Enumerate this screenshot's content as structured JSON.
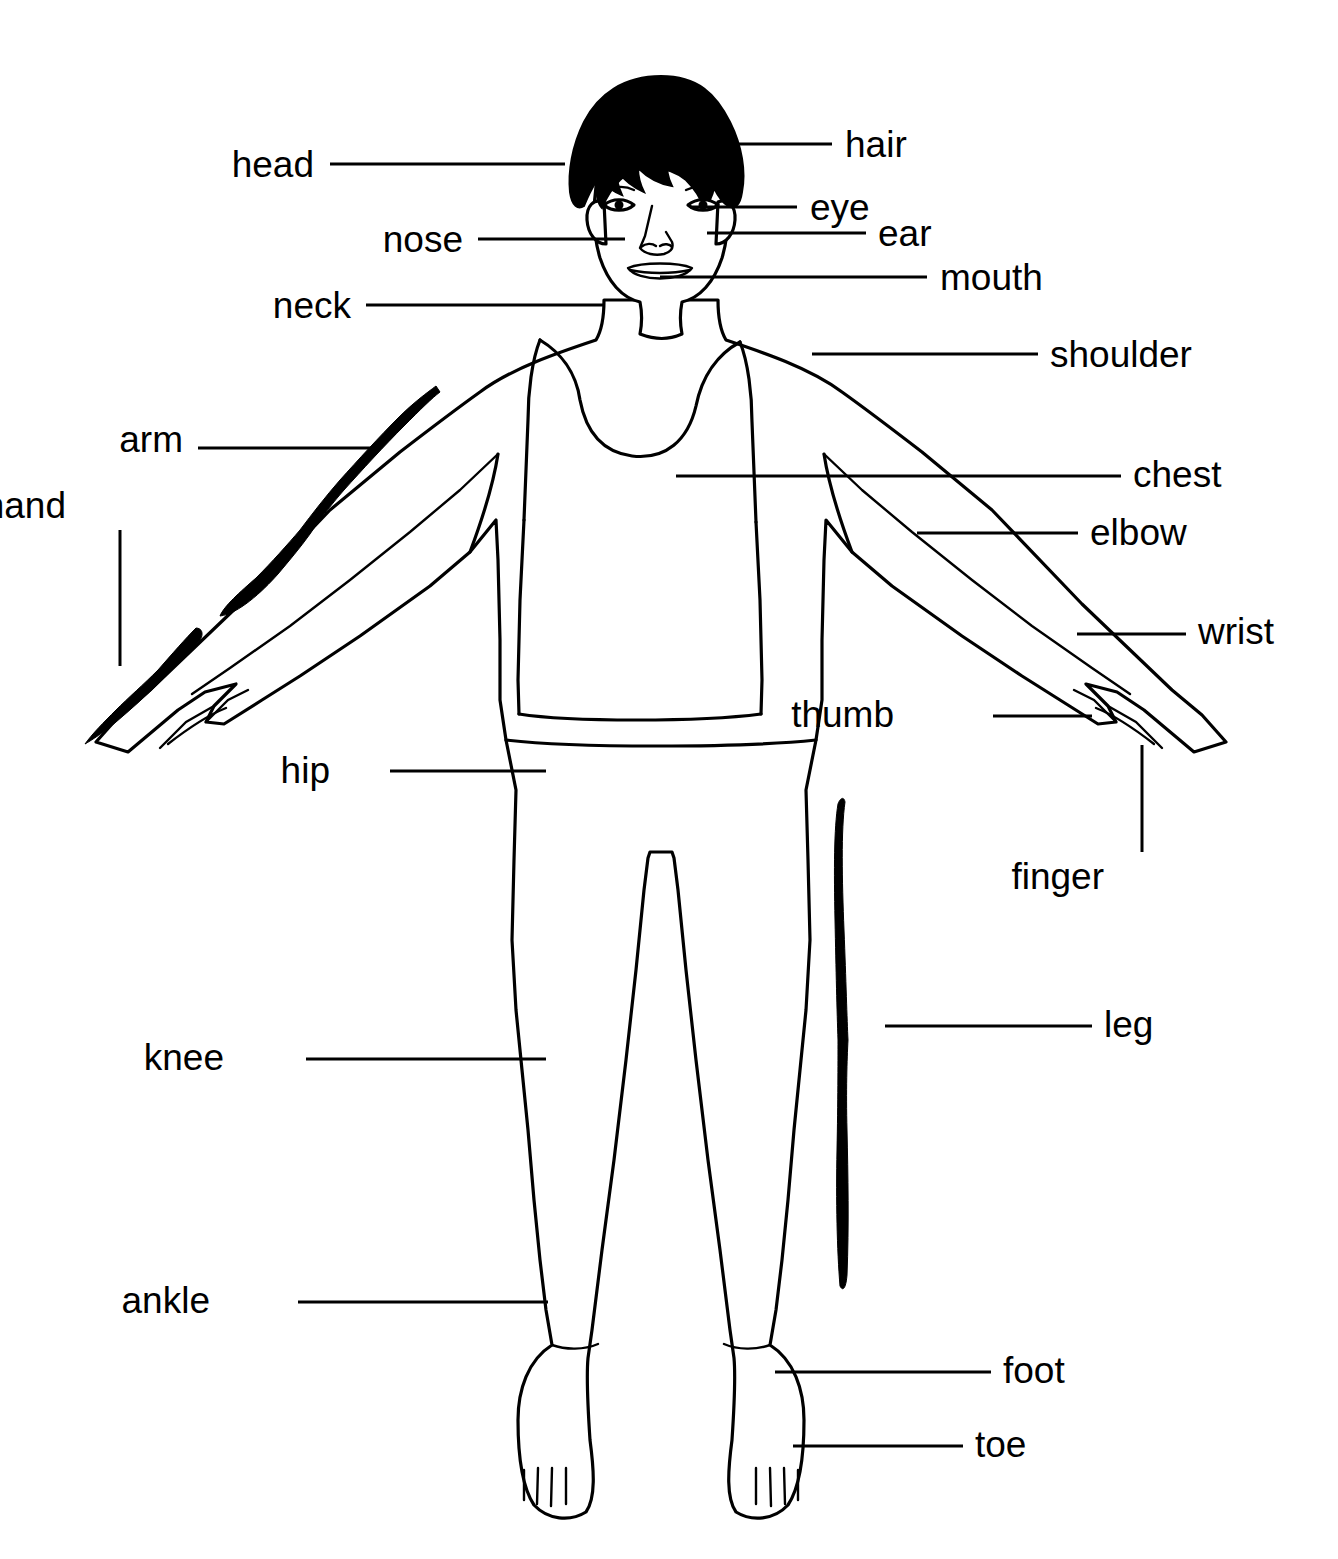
{
  "diagram": {
    "line_color": "#000000",
    "background_color": "#ffffff",
    "fill_color": "#ffffff",
    "hair_color": "#000000"
  },
  "labels": [
    {
      "id": "head",
      "text": "head",
      "side": "left",
      "text_x": 314,
      "text_y": 164,
      "line_x1": 330,
      "line_y1": 164,
      "line_x2": 565,
      "line_y2": 164
    },
    {
      "id": "hair",
      "text": "hair",
      "side": "right",
      "text_x": 845,
      "text_y": 144,
      "line_x1": 717,
      "line_y1": 144,
      "line_x2": 832,
      "line_y2": 144
    },
    {
      "id": "eye",
      "text": "eye",
      "side": "right",
      "text_x": 810,
      "text_y": 207,
      "line_x1": 690,
      "line_y1": 207,
      "line_x2": 797,
      "line_y2": 207
    },
    {
      "id": "ear",
      "text": "ear",
      "side": "right",
      "text_x": 878,
      "text_y": 233,
      "line_x1": 707,
      "line_y1": 233,
      "line_x2": 866,
      "line_y2": 233
    },
    {
      "id": "nose",
      "text": "nose",
      "side": "left",
      "text_x": 463,
      "text_y": 239,
      "line_x1": 478,
      "line_y1": 239,
      "line_x2": 625,
      "line_y2": 239
    },
    {
      "id": "mouth",
      "text": "mouth",
      "side": "right",
      "text_x": 940,
      "text_y": 277,
      "line_x1": 660,
      "line_y1": 277,
      "line_x2": 927,
      "line_y2": 277
    },
    {
      "id": "neck",
      "text": "neck",
      "side": "left",
      "text_x": 351,
      "text_y": 305,
      "line_x1": 366,
      "line_y1": 305,
      "line_x2": 605,
      "line_y2": 305
    },
    {
      "id": "shoulder",
      "text": "shoulder",
      "side": "right",
      "text_x": 1050,
      "text_y": 354,
      "line_x1": 812,
      "line_y1": 354,
      "line_x2": 1038,
      "line_y2": 354
    },
    {
      "id": "arm",
      "text": "arm",
      "side": "left",
      "text_x": 183,
      "text_y": 439,
      "line_x1": 198,
      "line_y1": 448,
      "line_x2": 378,
      "line_y2": 448
    },
    {
      "id": "chest",
      "text": "chest",
      "side": "right",
      "text_x": 1133,
      "text_y": 474,
      "line_x1": 676,
      "line_y1": 476,
      "line_x2": 1121,
      "line_y2": 476
    },
    {
      "id": "hand",
      "text": "hand",
      "side": "left",
      "text_x": 66,
      "text_y": 505,
      "line_x1": 120,
      "line_y1": 530,
      "line_x2": 120,
      "line_y2": 666
    },
    {
      "id": "elbow",
      "text": "elbow",
      "side": "right",
      "text_x": 1090,
      "text_y": 532,
      "line_x1": 917,
      "line_y1": 533,
      "line_x2": 1078,
      "line_y2": 533
    },
    {
      "id": "wrist",
      "text": "wrist",
      "side": "right",
      "text_x": 1198,
      "text_y": 631,
      "line_x1": 1077,
      "line_y1": 634,
      "line_x2": 1186,
      "line_y2": 634
    },
    {
      "id": "thumb",
      "text": "thumb",
      "side": "left",
      "text_x": 894,
      "text_y": 714,
      "line_x1": 993,
      "line_y1": 716,
      "line_x2": 1092,
      "line_y2": 716
    },
    {
      "id": "hip",
      "text": "hip",
      "side": "left",
      "text_x": 330,
      "text_y": 770,
      "line_x1": 390,
      "line_y1": 771,
      "line_x2": 546,
      "line_y2": 771
    },
    {
      "id": "finger",
      "text": "finger",
      "side": "left",
      "text_x": 1104,
      "text_y": 876,
      "line_x1": 1142,
      "line_y1": 745,
      "line_x2": 1142,
      "line_y2": 852
    },
    {
      "id": "leg",
      "text": "leg",
      "side": "right",
      "text_x": 1104,
      "text_y": 1024,
      "line_x1": 885,
      "line_y1": 1026,
      "line_x2": 1092,
      "line_y2": 1026
    },
    {
      "id": "knee",
      "text": "knee",
      "side": "left",
      "text_x": 224,
      "text_y": 1057,
      "line_x1": 306,
      "line_y1": 1059,
      "line_x2": 546,
      "line_y2": 1059
    },
    {
      "id": "ankle",
      "text": "ankle",
      "side": "left",
      "text_x": 210,
      "text_y": 1300,
      "line_x1": 298,
      "line_y1": 1302,
      "line_x2": 548,
      "line_y2": 1302
    },
    {
      "id": "foot",
      "text": "foot",
      "side": "right",
      "text_x": 1003,
      "text_y": 1370,
      "line_x1": 775,
      "line_y1": 1372,
      "line_x2": 991,
      "line_y2": 1372
    },
    {
      "id": "toe",
      "text": "toe",
      "side": "right",
      "text_x": 975,
      "text_y": 1444,
      "line_x1": 793,
      "line_y1": 1446,
      "line_x2": 963,
      "line_y2": 1446
    }
  ],
  "highlight_marks": [
    {
      "id": "arm-highlight",
      "description": "thick black stroke along the figure's right arm (viewer left)"
    },
    {
      "id": "hand-highlight",
      "description": "thick black stroke along the figure's right hand (viewer left)"
    },
    {
      "id": "leg-highlight",
      "description": "thick black vertical stroke beside the figure's left leg (viewer right)"
    }
  ]
}
